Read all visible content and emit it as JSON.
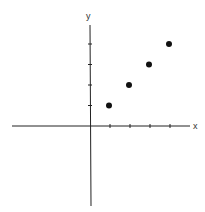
{
  "chart_data": {
    "type": "scatter",
    "title": "",
    "xlabel": "x",
    "ylabel": "y",
    "x": [
      1,
      2,
      3,
      4
    ],
    "y": [
      1,
      2,
      3,
      4
    ],
    "series": [
      {
        "name": "points",
        "x": [
          1,
          2,
          3,
          4
        ],
        "y": [
          1,
          2,
          3,
          4
        ]
      }
    ],
    "xlim": [
      -4.0,
      5.0
    ],
    "ylim": [
      -4.0,
      5.5
    ],
    "x_ticks": [
      1,
      2,
      3,
      4
    ],
    "y_ticks": [
      1,
      2,
      3,
      4
    ],
    "grid": false,
    "legend": "none"
  },
  "axes": {
    "x_label": "x",
    "y_label": "y"
  },
  "colors": {
    "axis": "#222222",
    "point": "#111111"
  }
}
